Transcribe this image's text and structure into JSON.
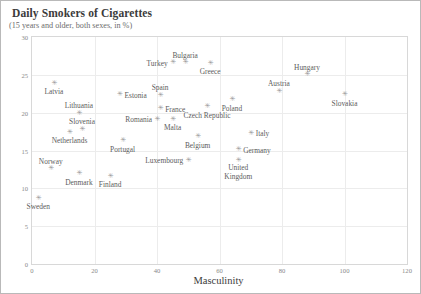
{
  "chart": {
    "title": "Daily Smokers of Cigarettes",
    "subtitle": "(15 years and older, both sexes, in %)",
    "xlabel": "Masculinity"
  },
  "chart_data": {
    "type": "scatter",
    "title": "Daily Smokers of Cigarettes",
    "subtitle": "(15 years and older, both sexes, in %)",
    "xlabel": "Masculinity",
    "ylabel": "",
    "xlim": [
      0,
      120
    ],
    "ylim": [
      0,
      30
    ],
    "xticks": [
      0,
      20,
      40,
      60,
      80,
      100,
      120
    ],
    "yticks": [
      0,
      5,
      10,
      15,
      20,
      25,
      30
    ],
    "grid": true,
    "legend": false,
    "marker": "asterisk",
    "marker_color": "#9a9a9a",
    "points": [
      {
        "label": "Turkey",
        "x": 45,
        "y": 26.6,
        "label_pos": "left"
      },
      {
        "label": "Bulgaria",
        "x": 49,
        "y": 26.6,
        "label_pos": "above"
      },
      {
        "label": "Greece",
        "x": 57,
        "y": 26.5,
        "label_pos": "below"
      },
      {
        "label": "Hungary",
        "x": 88,
        "y": 25.0,
        "label_pos": "above"
      },
      {
        "label": "Latvia",
        "x": 7,
        "y": 23.9,
        "label_pos": "below"
      },
      {
        "label": "Austria",
        "x": 79,
        "y": 22.8,
        "label_pos": "above"
      },
      {
        "label": "Slovakia",
        "x": 100,
        "y": 22.4,
        "label_pos": "below"
      },
      {
        "label": "Spain",
        "x": 41,
        "y": 22.3,
        "label_pos": "above"
      },
      {
        "label": "Estonia",
        "x": 28,
        "y": 22.4,
        "label_pos": "right"
      },
      {
        "label": "Poland",
        "x": 64,
        "y": 21.7,
        "label_pos": "below"
      },
      {
        "label": "Lithuania",
        "x": 15,
        "y": 19.9,
        "label_pos": "above"
      },
      {
        "label": "France",
        "x": 41,
        "y": 20.5,
        "label_pos": "right"
      },
      {
        "label": "Czech Republic",
        "x": 56,
        "y": 20.8,
        "label_pos": "below"
      },
      {
        "label": "Romania",
        "x": 40,
        "y": 19.1,
        "label_pos": "left"
      },
      {
        "label": "Malta",
        "x": 45,
        "y": 19.1,
        "label_pos": "below"
      },
      {
        "label": "Slovenia",
        "x": 16,
        "y": 17.8,
        "label_pos": "above"
      },
      {
        "label": "Netherlands",
        "x": 12,
        "y": 17.4,
        "label_pos": "below"
      },
      {
        "label": "Italy",
        "x": 70,
        "y": 17.3,
        "label_pos": "right"
      },
      {
        "label": "Belgium",
        "x": 53,
        "y": 16.8,
        "label_pos": "below"
      },
      {
        "label": "Germany",
        "x": 66,
        "y": 15.1,
        "label_pos": "right"
      },
      {
        "label": "Portugal",
        "x": 29,
        "y": 16.3,
        "label_pos": "below"
      },
      {
        "label": "United Kingdom",
        "x": 66,
        "y": 13.7,
        "label_pos": "below2"
      },
      {
        "label": "Luxembourg",
        "x": 50,
        "y": 13.7,
        "label_pos": "left"
      },
      {
        "label": "Norway",
        "x": 6,
        "y": 12.6,
        "label_pos": "above"
      },
      {
        "label": "Denmark",
        "x": 15,
        "y": 11.9,
        "label_pos": "below"
      },
      {
        "label": "Finland",
        "x": 25,
        "y": 11.6,
        "label_pos": "below"
      },
      {
        "label": "Sweden",
        "x": 2,
        "y": 8.7,
        "label_pos": "below"
      }
    ]
  }
}
